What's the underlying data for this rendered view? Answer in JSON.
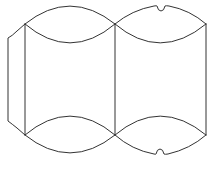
{
  "diagram": {
    "type": "pillow-box-die-line-template",
    "stroke_color": "#333333",
    "background_color": "#ffffff",
    "stroke_width": 1,
    "panels": [
      {
        "name": "glue-flap",
        "side": "left"
      },
      {
        "name": "front-panel"
      },
      {
        "name": "back-panel"
      }
    ],
    "features": {
      "curved_end_flaps": 4,
      "thumb_notches": 2
    }
  }
}
